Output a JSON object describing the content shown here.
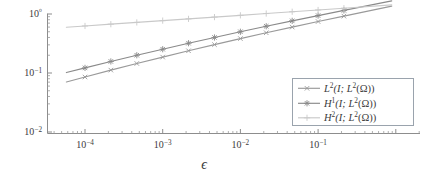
{
  "chart_data": {
    "type": "line",
    "title": "",
    "subtitle": "",
    "xlabel": "ϵ",
    "ylabel": "",
    "xscale": "log",
    "yscale": "log",
    "xlim": [
      7e-05,
      0.33
    ],
    "ylim": [
      0.01,
      1.5
    ],
    "grid": false,
    "legend_position": "lower right",
    "xticks": [
      0.0001,
      0.001,
      0.01,
      0.1
    ],
    "xticklabels": [
      "10−4",
      "10−3",
      "10−2",
      "10−1"
    ],
    "yticks": [
      0.01,
      0.1,
      1
    ],
    "yticklabels": [
      "10−2",
      "10−1",
      "10⁰"
    ],
    "series": [
      {
        "name": "L²(I; L²(Ω))",
        "marker": "x",
        "color": "#9a9a9a",
        "x": [
          0.0001,
          0.000215,
          0.000464,
          0.001,
          0.00215,
          0.00464,
          0.01,
          0.0215,
          0.0464,
          0.1,
          0.215
        ],
        "y": [
          0.0855,
          0.112,
          0.145,
          0.186,
          0.238,
          0.303,
          0.383,
          0.481,
          0.6,
          0.745,
          0.92
        ]
      },
      {
        "name": "H¹(I; L²(Ω))",
        "marker": "star",
        "color": "#8a8a8a",
        "x": [
          0.0001,
          0.000215,
          0.000464,
          0.001,
          0.00215,
          0.00464,
          0.01,
          0.0215,
          0.0464,
          0.1,
          0.215
        ],
        "y": [
          0.122,
          0.157,
          0.2,
          0.253,
          0.32,
          0.4,
          0.5,
          0.62,
          0.765,
          0.94,
          1.15
        ]
      },
      {
        "name": "H²(I; L²(Ω))",
        "marker": "plus",
        "color": "#c9c9c9",
        "x": [
          0.0001,
          0.000215,
          0.000464,
          0.001,
          0.00215,
          0.00464,
          0.01,
          0.0215,
          0.0464,
          0.1,
          0.215
        ],
        "y": [
          0.627,
          0.672,
          0.72,
          0.772,
          0.827,
          0.886,
          0.95,
          1.018,
          1.091,
          1.169,
          1.253
        ]
      }
    ],
    "legend": [
      "L²(I; L²(Ω))",
      "H¹(I; L²(Ω))",
      "H²(I; L²(Ω))"
    ],
    "legend_math": [
      {
        "base": "L",
        "exp": "2",
        "arg": "(I; L",
        "argexp": "2",
        "tail": "(Ω))"
      },
      {
        "base": "H",
        "exp": "1",
        "arg": "(I; L",
        "argexp": "2",
        "tail": "(Ω))"
      },
      {
        "base": "H",
        "exp": "2",
        "arg": "(I; L",
        "argexp": "2",
        "tail": "(Ω))"
      }
    ],
    "axis_color": "#8d8d8d",
    "text_color": "#3b3b3b",
    "legend_border_color": "#9aa3ad",
    "background": "#ffffff"
  }
}
